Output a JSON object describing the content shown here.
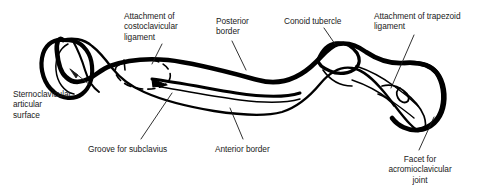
{
  "figure": {
    "view": "inferior surface of right clavicle",
    "ink_color": "#000000",
    "text_color": "#1a1a1a",
    "background_color": "#ffffff"
  },
  "labels": [
    {
      "id": "costoclavicular",
      "text": "Attachment of\ncostoclavicular\nligament",
      "align": "lft",
      "x": 124,
      "y": 11,
      "width": 84
    },
    {
      "id": "posterior-border",
      "text": "Posterior\nborder",
      "align": "lft",
      "x": 216,
      "y": 16,
      "width": 58
    },
    {
      "id": "conoid-tubercle",
      "text": "Conoid tubercle",
      "align": "lft",
      "x": 284,
      "y": 16,
      "width": 76
    },
    {
      "id": "trapezoid",
      "text": "Attachment of trapezoid\nligament",
      "align": "lft",
      "x": 374,
      "y": 11,
      "width": 108
    },
    {
      "id": "sternoclavicular",
      "text": "Sternoclavicular\narticular\nsurface",
      "align": "lft",
      "x": 13,
      "y": 89,
      "width": 76
    },
    {
      "id": "groove-subclavius",
      "text": "Groove for subclavius",
      "align": "lft",
      "x": 88,
      "y": 144,
      "width": 96
    },
    {
      "id": "anterior-border",
      "text": "Anterior border",
      "align": "lft",
      "x": 215,
      "y": 144,
      "width": 72
    },
    {
      "id": "acromioclavicular",
      "text": "Facet for\nacromioclavicular\njoint",
      "align": "ctr",
      "x": 374,
      "y": 154,
      "width": 92
    }
  ],
  "leaders": [
    {
      "id": "leader-costoclavicular",
      "from_label": "costoclavicular",
      "points": "162,44 152,64"
    },
    {
      "id": "leader-posterior-border",
      "from_label": "posterior-border",
      "points": "232,41 246,70"
    },
    {
      "id": "leader-conoid-tubercle",
      "from_label": "conoid-tubercle",
      "points": "324,28 335,44"
    },
    {
      "id": "leader-trapezoid",
      "from_label": "trapezoid",
      "points": "414,35 391,88"
    },
    {
      "id": "leader-sternoclavicular",
      "from_label": "sternoclavicular",
      "points": "90,85 70,69"
    },
    {
      "id": "leader-groove-subclavius",
      "from_label": "groove-subclavius",
      "points": "141,139 172,93"
    },
    {
      "id": "leader-anterior-border",
      "from_label": "anterior-border",
      "points": "243,139 230,108"
    },
    {
      "id": "leader-acromioclavicular",
      "from_label": "acromioclavicular",
      "points": "419,150 434,117"
    }
  ],
  "features": [
    {
      "id": "sternal-end",
      "name": "sternal (medial) end"
    },
    {
      "id": "shaft",
      "name": "clavicular shaft"
    },
    {
      "id": "conoid-tubercle-bump",
      "name": "conoid tubercle"
    },
    {
      "id": "acromial-end",
      "name": "acromial (lateral) end"
    },
    {
      "id": "subclavian-groove",
      "name": "groove for subclavius"
    }
  ]
}
